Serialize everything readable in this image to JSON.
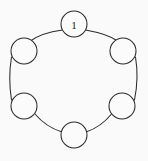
{
  "diagram": {
    "type": "cycle-graph",
    "background_color": "#fafafa",
    "stroke_color": "#2b2b2b",
    "node_fill_color": "#fbfbfb",
    "node_count": 6,
    "edge_count": 6,
    "node_radius": 13,
    "ring_radius": 57,
    "center": {
      "x": 74,
      "y": 78
    },
    "nodes": [
      {
        "id": "node-top",
        "label": "1",
        "cx": 74,
        "cy": 24,
        "r": 13
      },
      {
        "id": "node-upper-right",
        "label": "",
        "cx": 123,
        "cy": 51,
        "r": 13
      },
      {
        "id": "node-lower-right",
        "label": "",
        "cx": 122,
        "cy": 106,
        "r": 13
      },
      {
        "id": "node-bottom",
        "label": "",
        "cx": 74,
        "cy": 135,
        "r": 13
      },
      {
        "id": "node-lower-left",
        "label": "",
        "cx": 24,
        "cy": 106,
        "r": 13
      },
      {
        "id": "node-upper-left",
        "label": "",
        "cx": 24,
        "cy": 51,
        "r": 13
      }
    ],
    "edges": [
      {
        "id": "edge-top-to-upper-right",
        "from": "node-top",
        "to": "node-upper-right",
        "path": "M 85.5 30 Q 108 34 117.5 41"
      },
      {
        "id": "edge-upper-right-to-lower-right",
        "from": "node-upper-right",
        "to": "node-lower-right",
        "path": "M 135.5 57 Q 139 78 134.5 100"
      },
      {
        "id": "edge-lower-right-to-bottom",
        "from": "node-lower-right",
        "to": "node-bottom",
        "path": "M 111.5 114 Q 101 127 86 132"
      },
      {
        "id": "edge-bottom-to-lower-left",
        "from": "node-bottom",
        "to": "node-lower-left",
        "path": "M 62 132 Q 46 127 35 114"
      },
      {
        "id": "edge-lower-left-to-upper-left",
        "from": "node-lower-left",
        "to": "node-upper-left",
        "path": "M 11.5 100 Q 8 78 11.5 57"
      },
      {
        "id": "edge-upper-left-to-top",
        "from": "node-upper-left",
        "to": "node-top",
        "path": "M 30.5 41 Q 41 33 62.5 30"
      }
    ]
  }
}
